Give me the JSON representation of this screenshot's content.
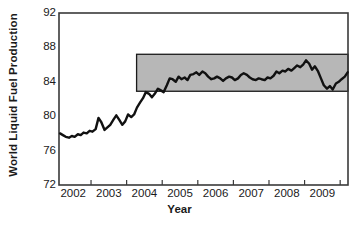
{
  "chart_data": {
    "type": "line",
    "title": "",
    "subtitle": "",
    "xlabel": "Year",
    "ylabel": "World Liquid Fuel Production",
    "xlim": [
      2001.6,
      2009.72
    ],
    "ylim": [
      72,
      92
    ],
    "ytick_values": [
      92,
      88,
      84,
      80,
      76,
      72
    ],
    "ytick_labels": [
      "92",
      "88",
      "84",
      "80",
      "76",
      "72"
    ],
    "xtick_values": [
      2002,
      2003,
      2004,
      2005,
      2006,
      2007,
      2008,
      2009
    ],
    "xtick_labels": [
      "2002",
      "2003",
      "2004",
      "2005",
      "2006",
      "2007",
      "2008",
      "2009"
    ],
    "grid": false,
    "legend": null,
    "legend_position": "none",
    "series": [
      {
        "name": "World Liquid Fuel Production",
        "color": "#111111",
        "linewidth": 2.4,
        "x": [
          2001.63,
          2001.71,
          2001.79,
          2001.88,
          2001.96,
          2002.04,
          2002.13,
          2002.21,
          2002.29,
          2002.38,
          2002.46,
          2002.54,
          2002.63,
          2002.71,
          2002.79,
          2002.88,
          2002.96,
          2003.04,
          2003.13,
          2003.21,
          2003.29,
          2003.38,
          2003.46,
          2003.54,
          2003.63,
          2003.71,
          2003.79,
          2003.88,
          2003.96,
          2004.04,
          2004.13,
          2004.21,
          2004.29,
          2004.38,
          2004.46,
          2004.54,
          2004.63,
          2004.71,
          2004.79,
          2004.88,
          2004.96,
          2005.04,
          2005.13,
          2005.21,
          2005.29,
          2005.38,
          2005.46,
          2005.54,
          2005.63,
          2005.71,
          2005.79,
          2005.88,
          2005.96,
          2006.04,
          2006.13,
          2006.21,
          2006.29,
          2006.38,
          2006.46,
          2006.54,
          2006.63,
          2006.71,
          2006.79,
          2006.88,
          2006.96,
          2007.04,
          2007.13,
          2007.21,
          2007.29,
          2007.38,
          2007.46,
          2007.54,
          2007.63,
          2007.71,
          2007.79,
          2007.88,
          2007.96,
          2008.04,
          2008.13,
          2008.21,
          2008.29,
          2008.38,
          2008.46,
          2008.54,
          2008.63,
          2008.71,
          2008.79,
          2008.88,
          2008.96,
          2009.04,
          2009.13,
          2009.21,
          2009.29,
          2009.38,
          2009.46,
          2009.54,
          2009.63,
          2009.71
        ],
        "y": [
          78.0,
          77.8,
          77.6,
          77.5,
          77.7,
          77.6,
          77.9,
          77.8,
          78.1,
          78.0,
          78.3,
          78.2,
          78.5,
          79.8,
          79.3,
          78.4,
          78.7,
          79.0,
          79.6,
          80.1,
          79.6,
          79.0,
          79.4,
          80.2,
          79.9,
          80.2,
          81.0,
          81.6,
          82.1,
          82.8,
          82.6,
          82.2,
          82.6,
          83.2,
          83.0,
          82.8,
          83.6,
          84.4,
          84.3,
          84.0,
          84.6,
          84.3,
          84.5,
          84.2,
          84.8,
          84.9,
          85.1,
          84.8,
          85.2,
          85.0,
          84.6,
          84.3,
          84.4,
          84.6,
          84.4,
          84.1,
          84.4,
          84.6,
          84.5,
          84.2,
          84.4,
          84.8,
          85.0,
          84.8,
          84.5,
          84.3,
          84.2,
          84.4,
          84.3,
          84.2,
          84.5,
          84.4,
          84.7,
          85.2,
          85.0,
          85.3,
          85.2,
          85.5,
          85.3,
          85.6,
          85.9,
          85.7,
          86.0,
          86.5,
          86.1,
          85.4,
          85.8,
          85.2,
          84.4,
          83.6,
          83.2,
          83.5,
          83.1,
          83.8,
          84.0,
          84.3,
          84.6,
          85.1
        ]
      }
    ],
    "annotations": [
      {
        "name": "plateau-band",
        "type": "rectangle",
        "x0": 2003.78,
        "x1": 2009.72,
        "y0": 82.9,
        "y1": 87.2,
        "fill": "#b7b7b7",
        "stroke": "#1a1a1a"
      }
    ],
    "colors": {
      "line": "#111111",
      "band_fill": "#b7b7b7",
      "band_stroke": "#1a1a1a",
      "axis": "#3a3a3a",
      "text": "#1a1a1a",
      "background": "#ffffff"
    }
  }
}
